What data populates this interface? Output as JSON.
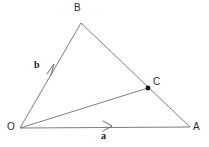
{
  "diagram": {
    "background_color": "#ffffff",
    "line_color": "#7d7d7d",
    "label_color": "#2b2b2b",
    "dot_color": "#101010",
    "width": 209,
    "height": 147
  },
  "points": {
    "O": {
      "label": "O",
      "x": 20,
      "y": 128,
      "label_x": 7,
      "label_y": 122
    },
    "A": {
      "label": "A",
      "x": 190,
      "y": 127,
      "label_x": 193,
      "label_y": 122
    },
    "B": {
      "label": "B",
      "x": 81,
      "y": 23,
      "label_x": 74,
      "label_y": 3
    },
    "C": {
      "label": "C",
      "x": 148,
      "y": 88,
      "label_x": 153,
      "label_y": 77
    }
  },
  "edges": [
    {
      "name": "side-OB",
      "from": "O",
      "to": "B"
    },
    {
      "name": "side-BA",
      "from": "B",
      "to": "A"
    },
    {
      "name": "side-OA",
      "from": "O",
      "to": "A"
    },
    {
      "name": "segment-OC",
      "from": "O",
      "to": "C"
    }
  ],
  "vectors": [
    {
      "name": "vector-b",
      "label": "b",
      "along": "side-OB",
      "label_x": 34,
      "label_y": 60,
      "arrow_x": 52,
      "arrow_y": 67
    },
    {
      "name": "vector-a",
      "label": "a",
      "along": "side-OA",
      "label_x": 101,
      "label_y": 131,
      "arrow_x": 108,
      "arrow_y": 126
    }
  ]
}
